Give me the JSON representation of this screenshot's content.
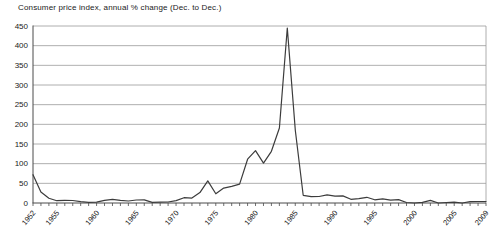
{
  "chart_data": {
    "type": "line",
    "title": "Consumer price index, annual % change (Dec. to Dec.)",
    "xlabel": "",
    "ylabel": "",
    "ylim": [
      0,
      450
    ],
    "ytick_interval": 50,
    "ytick_labels": [
      "0",
      "50",
      "100",
      "150",
      "200",
      "250",
      "300",
      "350",
      "400",
      "450"
    ],
    "grid": "horizontal",
    "legend": "none",
    "x_labeled_ticks": [
      1952,
      1955,
      1960,
      1965,
      1970,
      1975,
      1980,
      1985,
      1990,
      1995,
      2000,
      2005,
      2009
    ],
    "series_name": "CPI annual % change",
    "years": [
      1952,
      1953,
      1954,
      1955,
      1956,
      1957,
      1958,
      1959,
      1960,
      1961,
      1962,
      1963,
      1964,
      1965,
      1966,
      1967,
      1968,
      1969,
      1970,
      1971,
      1972,
      1973,
      1974,
      1975,
      1976,
      1977,
      1978,
      1979,
      1980,
      1981,
      1982,
      1983,
      1984,
      1985,
      1986,
      1987,
      1988,
      1989,
      1990,
      1991,
      1992,
      1993,
      1994,
      1995,
      1996,
      1997,
      1998,
      1999,
      2000,
      2001,
      2002,
      2003,
      2004,
      2005,
      2006,
      2007,
      2008,
      2009
    ],
    "values": [
      72,
      28,
      12.3,
      5.9,
      6.5,
      6.4,
      3.4,
      1.5,
      2.3,
      6.7,
      9.5,
      6.6,
      5.2,
      7.7,
      8.0,
      1.6,
      2.1,
      2.5,
      6.1,
      13.4,
      12.4,
      26.4,
      56.2,
      23.5,
      38.0,
      42.5,
      48.1,
      111.4,
      132.9,
      101.5,
      131.5,
      190.7,
      444.9,
      185.2,
      19.6,
      16.1,
      16.4,
      20.7,
      17.6,
      18.0,
      9.4,
      11.2,
      14.5,
      8.1,
      10.6,
      7.0,
      8.6,
      1.3,
      0.0,
      1.4,
      6.5,
      -1.9,
      1.2,
      2.4,
      -0.1,
      3.4,
      3.8,
      3.9
    ],
    "colors": {
      "line": "#3c3c3c",
      "grid": "#9a9a9a",
      "axis": "#4a4a4a",
      "text": "#1a1a1a",
      "background": "#ffffff"
    }
  }
}
